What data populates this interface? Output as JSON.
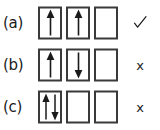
{
  "figure": {
    "type": "orbital-box-diagram",
    "colors": {
      "background": "#ffffff",
      "box_border": "#3a3a3a",
      "arrow": "#1a1a1a",
      "text": "#1a1a1a"
    },
    "rows": [
      {
        "label": "(a)",
        "boxes": [
          {
            "arrows": [
              "up"
            ]
          },
          {
            "arrows": [
              "up"
            ]
          },
          {
            "arrows": []
          }
        ],
        "mark": "check",
        "mark_glyph": "✓"
      },
      {
        "label": "(b)",
        "boxes": [
          {
            "arrows": [
              "up"
            ]
          },
          {
            "arrows": [
              "down"
            ]
          },
          {
            "arrows": []
          }
        ],
        "mark": "cross",
        "mark_glyph": "x"
      },
      {
        "label": "(c)",
        "boxes": [
          {
            "arrows": [
              "up",
              "down"
            ]
          },
          {
            "arrows": []
          },
          {
            "arrows": []
          }
        ],
        "mark": "cross",
        "mark_glyph": "x"
      }
    ]
  }
}
